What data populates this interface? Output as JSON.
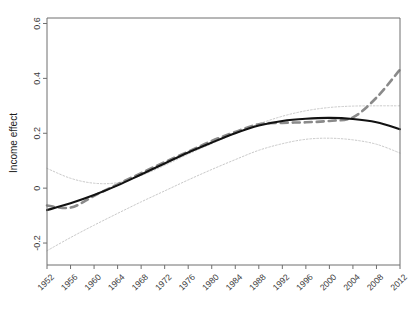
{
  "chart_data": {
    "type": "line",
    "title": "",
    "xlabel": "",
    "ylabel": "Income effect",
    "xlim": [
      1952,
      2012
    ],
    "ylim": [
      -0.28,
      0.62
    ],
    "grid": false,
    "legend_position": "none",
    "x_ticks": [
      "1952",
      "1956",
      "1960",
      "1964",
      "1968",
      "1972",
      "1976",
      "1980",
      "1984",
      "1988",
      "1992",
      "1996",
      "2000",
      "2004",
      "2008",
      "2012"
    ],
    "y_ticks": [
      "0.6",
      "0.4",
      "0.2",
      "0",
      "-0.2"
    ],
    "y_tick_values": [
      0.6,
      0.4,
      0.2,
      0,
      -0.2
    ],
    "x_tick_values": [
      1952,
      1956,
      1960,
      1964,
      1968,
      1972,
      1976,
      1980,
      1984,
      1988,
      1992,
      1996,
      2000,
      2004,
      2008,
      2012
    ],
    "series": [
      {
        "name": "Smoothed estimate",
        "style": "solid",
        "color": "#121212",
        "width": 2.1,
        "x": [
          1952,
          1956,
          1960,
          1964,
          1968,
          1972,
          1976,
          1980,
          1984,
          1988,
          1992,
          1996,
          2000,
          2004,
          2008,
          2012
        ],
        "values": [
          -0.08,
          -0.055,
          -0.025,
          0.01,
          0.05,
          0.09,
          0.13,
          0.166,
          0.2,
          0.228,
          0.245,
          0.253,
          0.256,
          0.252,
          0.24,
          0.215
        ]
      },
      {
        "name": "Year-by-year estimate",
        "style": "dashed",
        "color": "#8a8a8a",
        "width": 2.6,
        "x": [
          1952,
          1956,
          1960,
          1964,
          1968,
          1972,
          1976,
          1980,
          1984,
          1988,
          1992,
          1996,
          2000,
          2004,
          2008,
          2012
        ],
        "values": [
          -0.063,
          -0.071,
          -0.028,
          0.014,
          0.055,
          0.095,
          0.133,
          0.172,
          0.205,
          0.233,
          0.238,
          0.24,
          0.245,
          0.258,
          0.33,
          0.432
        ]
      },
      {
        "name": "Upper confidence bound",
        "style": "dotted",
        "color": "#c9c9c9",
        "width": 1.0,
        "x": [
          1952,
          1956,
          1960,
          1964,
          1968,
          1972,
          1976,
          1980,
          1984,
          1988,
          1992,
          1996,
          2000,
          2004,
          2008,
          2012
        ],
        "values": [
          0.072,
          0.036,
          0.018,
          0.02,
          0.046,
          0.083,
          0.124,
          0.162,
          0.2,
          0.234,
          0.262,
          0.282,
          0.294,
          0.299,
          0.3,
          0.3
        ]
      },
      {
        "name": "Lower confidence bound",
        "style": "dotted",
        "color": "#c9c9c9",
        "width": 1.0,
        "x": [
          1952,
          1956,
          1960,
          1964,
          1968,
          1972,
          1976,
          1980,
          1984,
          1988,
          1992,
          1996,
          2000,
          2004,
          2008,
          2012
        ],
        "values": [
          -0.228,
          -0.18,
          -0.135,
          -0.092,
          -0.05,
          -0.01,
          0.03,
          0.068,
          0.104,
          0.138,
          0.162,
          0.178,
          0.182,
          0.176,
          0.16,
          0.128
        ]
      }
    ]
  },
  "axes": {
    "frame_color": "#6f6f6f",
    "tick_color": "#6f6f6f"
  }
}
